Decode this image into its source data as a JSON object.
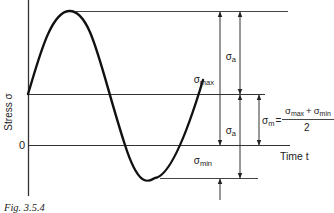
{
  "diagram": {
    "caption": "Fig. 3.5.4",
    "y_axis_label": "Stress σ",
    "x_axis_label": "Time t",
    "zero_label": "0",
    "labels": {
      "sigma_max": "σmax",
      "sigma_max_base": "σ",
      "sigma_max_sub": "max",
      "sigma_a_upper_base": "σ",
      "sigma_a_upper_sub": "a",
      "sigma_a_lower_base": "σ",
      "sigma_a_lower_sub": "a",
      "sigma_min_base": "σ",
      "sigma_min_sub": "min",
      "sigma_m_base": "σ",
      "sigma_m_sub": "m",
      "equals": "=",
      "formula_num_1_base": "σ",
      "formula_num_1_sub": "max",
      "formula_plus": "+",
      "formula_num_2_base": "σ",
      "formula_num_2_sub": "min",
      "formula_den": "2"
    },
    "colors": {
      "line": "#222222",
      "curve": "#111111",
      "background": "#ffffff"
    }
  }
}
